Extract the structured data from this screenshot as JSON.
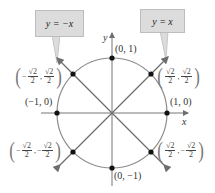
{
  "figure": {
    "axes": {
      "x_label": "x",
      "y_label": "y"
    },
    "callouts": [
      {
        "id": "neg",
        "text": "y = −x"
      },
      {
        "id": "pos",
        "text": "y = x"
      }
    ],
    "points": {
      "top": "(0, 1)",
      "bottom": "(0, −1)",
      "left": "(−1, 0)",
      "right": "(1, 0)",
      "q1": {
        "x_sign": "",
        "x_num": "√2",
        "x_den": "2",
        "y_sign": "",
        "y_num": "√2",
        "y_den": "2"
      },
      "q2": {
        "x_sign": "−",
        "x_num": "√2",
        "x_den": "2",
        "y_sign": "",
        "y_num": "√2",
        "y_den": "2"
      },
      "q3": {
        "x_sign": "−",
        "x_num": "√2",
        "x_den": "2",
        "y_sign": "−",
        "y_num": "√2",
        "y_den": "2"
      },
      "q4": {
        "x_sign": "",
        "x_num": "√2",
        "x_den": "2",
        "y_sign": "−",
        "y_num": "√2",
        "y_den": "2"
      }
    },
    "colors": {
      "circle": "#8c8c8c",
      "lines": "#6e6e6e",
      "points": "#111111",
      "callout_bg": "#dcdcdc"
    }
  }
}
